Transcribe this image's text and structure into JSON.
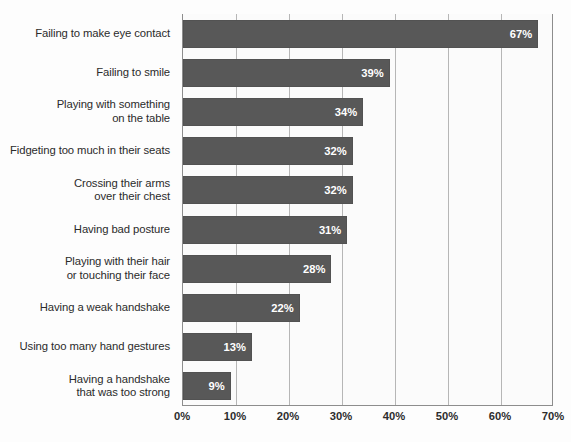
{
  "chart_data": {
    "type": "bar",
    "orientation": "horizontal",
    "title": "",
    "subtitle": "",
    "xlabel": "",
    "ylabel": "",
    "xlim": [
      0,
      70
    ],
    "grid": true,
    "legend": false,
    "x_ticks": [
      "0%",
      "10%",
      "20%",
      "30%",
      "40%",
      "50%",
      "60%",
      "70%"
    ],
    "x_tick_values": [
      0,
      10,
      20,
      30,
      40,
      50,
      60,
      70
    ],
    "categories": [
      "Failing to make eye contact",
      "Failing to smile",
      "Playing with something on the table",
      "Fidgeting too much in their seats",
      "Crossing their arms over their chest",
      "Having bad posture",
      "Playing with their hair or touching their face",
      "Having a weak handshake",
      "Using too many hand gestures",
      "Having a handshake that was too strong"
    ],
    "category_lines": [
      [
        "Failing to make eye contact"
      ],
      [
        "Failing to smile"
      ],
      [
        "Playing with something",
        "on the table"
      ],
      [
        "Fidgeting too much in their seats"
      ],
      [
        "Crossing their arms",
        "over their chest"
      ],
      [
        "Having bad posture"
      ],
      [
        "Playing with their hair",
        "or touching their face"
      ],
      [
        "Having a weak handshake"
      ],
      [
        "Using too many hand gestures"
      ],
      [
        "Having a handshake",
        "that was too strong"
      ]
    ],
    "values": [
      67,
      39,
      34,
      32,
      32,
      31,
      28,
      22,
      13,
      9
    ],
    "value_labels": [
      "67%",
      "39%",
      "34%",
      "32%",
      "32%",
      "31%",
      "28%",
      "22%",
      "13%",
      "9%"
    ],
    "colors": {
      "bar": "#585858",
      "value_label": "#ffffff",
      "gridline": "#b6b6b6",
      "axis": "#8d8d8d",
      "plot_background": "#fbfbfb",
      "category_label": "#2b2b2b"
    }
  }
}
